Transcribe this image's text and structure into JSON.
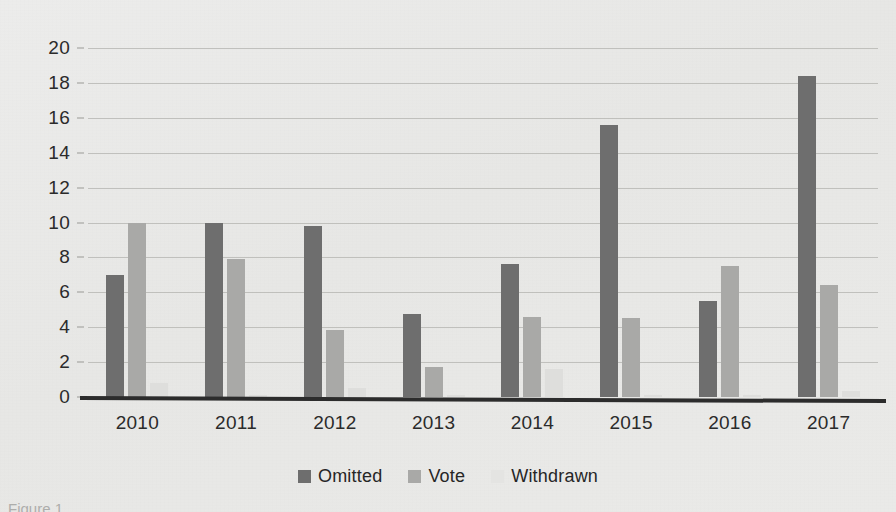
{
  "chart_data": {
    "type": "bar",
    "title": "",
    "subtitle": "",
    "xlabel": "",
    "ylabel": "",
    "categories": [
      "2010",
      "2011",
      "2012",
      "2013",
      "2014",
      "2015",
      "2016",
      "2017"
    ],
    "series": [
      {
        "name": "Omitted",
        "color": "#6e6e6e",
        "values": [
          7.0,
          10.0,
          9.8,
          4.75,
          7.6,
          15.6,
          5.5,
          18.4
        ]
      },
      {
        "name": "Vote",
        "color": "#a9a9a7",
        "values": [
          10.0,
          7.9,
          3.85,
          1.7,
          4.6,
          4.5,
          7.5,
          6.4
        ]
      },
      {
        "name": "Withdrawn",
        "color": "#dededc",
        "values": [
          0.8,
          0.1,
          0.5,
          0.1,
          1.6,
          0.1,
          0.1,
          0.35
        ]
      }
    ],
    "ylim": [
      0,
      20
    ],
    "ytick_step": 2,
    "yticks": [
      0,
      2,
      4,
      6,
      8,
      10,
      12,
      14,
      16,
      18,
      20
    ],
    "ytick_labels": [
      "0",
      "2",
      "4",
      "6",
      "8",
      "10",
      "12",
      "14",
      "16",
      "18",
      "20"
    ],
    "grid": true,
    "grid_axis": "y",
    "legend": true,
    "legend_position": "bottom-center",
    "legend_entries": [
      "Omitted",
      "Vote",
      "Withdrawn"
    ]
  },
  "legend": {
    "items": [
      {
        "label": "Omitted",
        "swatch": "s-omitted"
      },
      {
        "label": "Vote",
        "swatch": "s-vote"
      },
      {
        "label": "Withdrawn",
        "swatch": "s-withdrawn"
      }
    ]
  },
  "caption": {
    "fragment": "Figure 1."
  },
  "colors": {
    "omitted": "#6e6e6e",
    "vote": "#a9a9a7",
    "withdrawn": "#dededc",
    "gridline": "#b9b9b5",
    "axis": "#2c2c2c",
    "background": "#e9e9e7",
    "text": "#2b2b2b"
  }
}
